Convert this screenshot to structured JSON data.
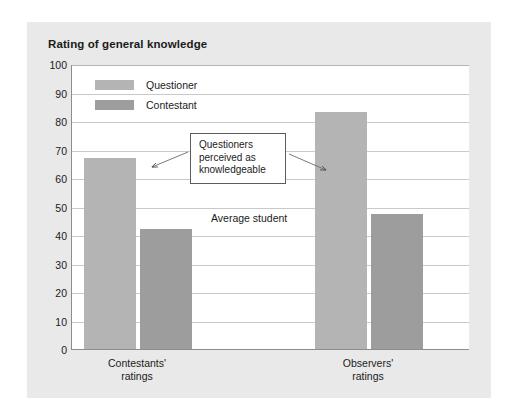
{
  "chart_data": {
    "type": "bar",
    "title": "Rating of general knowledge",
    "xlabel": "",
    "ylabel": "",
    "ylim": [
      0,
      100
    ],
    "ytick_step": 10,
    "yticks": [
      "100",
      "90",
      "80",
      "70",
      "60",
      "50",
      "40",
      "30",
      "20",
      "10",
      "0"
    ],
    "grid": true,
    "legend_position": "upper-left-inside",
    "categories": [
      "Contestants' ratings",
      "Observers' ratings"
    ],
    "category_lines": [
      [
        "Contestants'",
        "ratings"
      ],
      [
        "Observers'",
        "ratings"
      ]
    ],
    "series": [
      {
        "name": "Questioner",
        "color": "#b4b4b4",
        "values": [
          67,
          83
        ]
      },
      {
        "name": "Contestant",
        "color": "#9d9d9d",
        "values": [
          42,
          47.5
        ]
      }
    ],
    "annotations": [
      {
        "id": "callout",
        "lines": [
          "Questioners",
          "perceived as",
          "knowledgeable"
        ],
        "boxed": true,
        "arrows": 2
      },
      {
        "id": "average-student",
        "text": "Average student",
        "boxed": false
      }
    ]
  },
  "colors": {
    "panel_background": "#e9e9e9",
    "plot_background": "#ffffff",
    "axis": "#8d8d8d",
    "gridline": "#c9c9c9",
    "text": "#1b1b1b",
    "questioner": "#b4b4b4",
    "contestant": "#9d9d9d"
  }
}
